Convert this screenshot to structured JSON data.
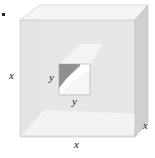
{
  "figure": {
    "type": "cube-with-square-hole",
    "colors": {
      "front_face": "#e6e6e6",
      "top_face": "#f3f3f3",
      "right_face": "#d2d2d2",
      "bottom_inner": "#f2f2f2",
      "hole_left_wall": "#9a9a9a",
      "hole_bottom_wall": "#f7f7f7",
      "hole_back": "#ffffff",
      "edge": "#bdbdbd",
      "label": "#222222"
    }
  },
  "labels": {
    "cube_height": "x",
    "cube_width": "x",
    "cube_depth": "x",
    "hole_height": "y",
    "hole_width": "y"
  }
}
